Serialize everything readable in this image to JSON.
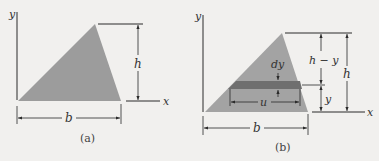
{
  "colors": {
    "background": "#f1f0ee",
    "triangle_fill": "#9c9c9c",
    "strip_fill": "#6f6f6f",
    "line": "#2a2a2a"
  },
  "panel_a": {
    "caption": "(a)",
    "axis_labels": {
      "y": "y",
      "x": "x"
    },
    "dimensions": {
      "height": "h",
      "base": "b"
    }
  },
  "panel_b": {
    "caption": "(b)",
    "axis_labels": {
      "y": "y",
      "x": "x"
    },
    "dimensions": {
      "height": "h",
      "base": "b",
      "upper": "h − y",
      "lower": "y",
      "strip_thickness": "dy",
      "strip_width": "u"
    }
  }
}
